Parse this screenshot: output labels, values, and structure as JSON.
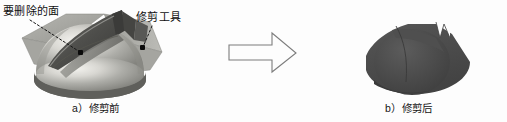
{
  "figure": {
    "kind": "technical-illustration",
    "topic": "surface-trim-operation",
    "background_color": "#fdfdfd"
  },
  "annotations": {
    "delete_face_label": "要删除的面",
    "trim_tool_label": "修剪工具",
    "leader_line_style": "dotted",
    "leader_color": "#1a1a1a",
    "marker_color": "#0b0b0b"
  },
  "captions": {
    "before": "a）修剪前",
    "after": "b）修剪后"
  },
  "arrow": {
    "name": "transition-arrow",
    "direction": "right",
    "fill": "none",
    "stroke": "#7d7d7d"
  },
  "panels": [
    {
      "id": "before",
      "caption": "a）修剪前",
      "description": "dome solid with trimming surface passing through it",
      "colors": {
        "plate": "#a9a9a4",
        "plate_shadow": "#8d8d88",
        "dome_light": "#efeeea",
        "dome_mid": "#b0b0ab",
        "dome_dark": "#7c7c78",
        "base_rim": "#6f6f6b",
        "trim_surface": "#4f4f4d",
        "trim_surface_light": "#8a8a86"
      }
    },
    {
      "id": "after",
      "caption": "b）修剪后",
      "description": "resulting trimmed solid after removal of the selected face",
      "colors": {
        "body": "#4a4a4a",
        "body_light": "#585858",
        "notch": "#fdfdfd"
      }
    }
  ]
}
